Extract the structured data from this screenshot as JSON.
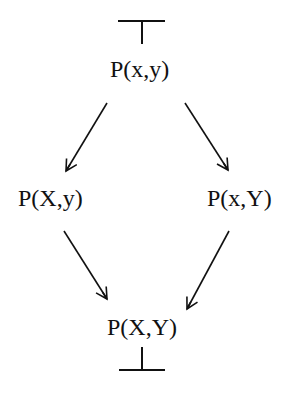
{
  "diagram": {
    "top_symbol": "⊤",
    "bottom_symbol": "⊥",
    "nodes": {
      "top": "P(x,y)",
      "left": "P(X,y)",
      "right": "P(x,Y)",
      "bottom": "P(X,Y)"
    },
    "edges": [
      {
        "from": "P(x,y)",
        "to": "P(X,y)"
      },
      {
        "from": "P(x,y)",
        "to": "P(x,Y)"
      },
      {
        "from": "P(X,y)",
        "to": "P(X,Y)"
      },
      {
        "from": "P(x,Y)",
        "to": "P(X,Y)"
      }
    ],
    "colors": {
      "ink": "#111111",
      "background": "#ffffff"
    }
  }
}
